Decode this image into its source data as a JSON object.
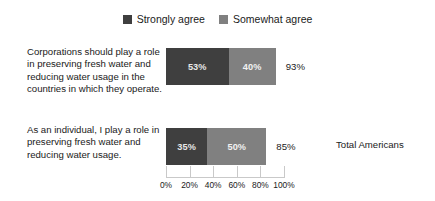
{
  "chart_data": {
    "type": "bar",
    "orientation": "horizontal",
    "stacked": true,
    "title": "",
    "subtitle": "",
    "xlabel": "",
    "ylabel": "",
    "xlim": [
      0,
      100
    ],
    "grid": false,
    "legend_position": "top-center",
    "categories": [
      "Corporations should play a role in preserving fresh water and reducing water usage in the countries in which they operate.",
      "As an individual, I play a role in preserving fresh water and reducing water usage."
    ],
    "series": [
      {
        "name": "Strongly agree",
        "color": "#3f3f3f",
        "values": [
          53,
          35
        ],
        "value_labels": [
          "53%",
          "35%"
        ]
      },
      {
        "name": "Somewhat agree",
        "color": "#808080",
        "values": [
          40,
          50
        ],
        "value_labels": [
          "40%",
          "50%"
        ]
      }
    ],
    "totals": [
      93,
      85
    ],
    "total_labels": [
      "93%",
      "85%"
    ],
    "x_ticks": [
      0,
      20,
      40,
      60,
      80,
      100
    ],
    "x_tick_labels": [
      "0%",
      "20%",
      "40%",
      "60%",
      "80%",
      "100%"
    ],
    "annotations": [
      "Total Americans"
    ]
  },
  "legend": {
    "items": [
      {
        "label": "Strongly agree",
        "color": "#3f3f3f"
      },
      {
        "label": "Somewhat agree",
        "color": "#808080"
      }
    ]
  },
  "rows": [
    {
      "label": "Corporations should play a role in preserving fresh water and reducing water usage in the countries in which they operate.",
      "strongly_agree": "53%",
      "somewhat_agree": "40%",
      "total": "93%"
    },
    {
      "label": "As an individual, I play a role in preserving fresh water and reducing water usage.",
      "strongly_agree": "35%",
      "somewhat_agree": "50%",
      "total": "85%"
    }
  ],
  "axis": {
    "tick_labels": [
      "0%",
      "20%",
      "40%",
      "60%",
      "80%",
      "100%"
    ]
  },
  "side_note": {
    "text": "Total Americans"
  },
  "colors": {
    "strongly_agree": "#3f3f3f",
    "somewhat_agree": "#808080",
    "text": "#1a1a1a",
    "axis": "#c9c9c9",
    "background": "#ffffff"
  }
}
